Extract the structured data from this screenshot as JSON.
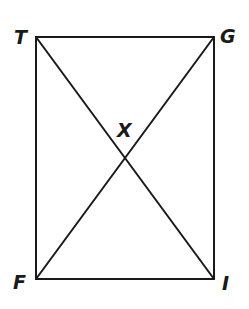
{
  "diagram": {
    "type": "rectangle-with-diagonals",
    "vertices": [
      {
        "label": "T",
        "x": 36,
        "y": 37,
        "label_x": 18,
        "label_y": 44
      },
      {
        "label": "G",
        "x": 214,
        "y": 37,
        "label_x": 220,
        "label_y": 43
      },
      {
        "label": "I",
        "x": 214,
        "y": 279,
        "label_x": 222,
        "label_y": 290
      },
      {
        "label": "F",
        "x": 36,
        "y": 279,
        "label_x": 14,
        "label_y": 289
      }
    ],
    "intersection": {
      "label": "X",
      "x": 125,
      "y": 158,
      "label_x": 118,
      "label_y": 137
    },
    "segments": [
      "TG",
      "GI",
      "IF",
      "FT",
      "TI",
      "GF"
    ],
    "colors": {
      "stroke": "#1a1a1a",
      "background": "#ffffff"
    }
  }
}
